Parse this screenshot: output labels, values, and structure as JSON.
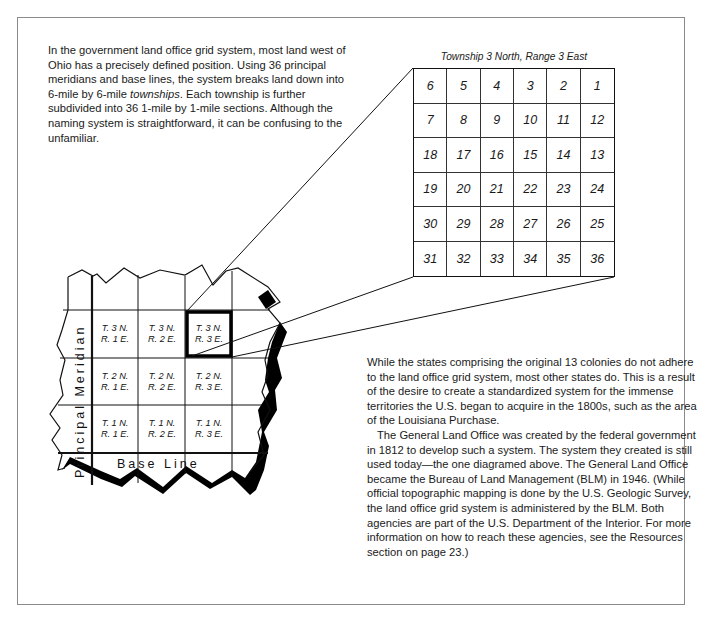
{
  "intro": {
    "line_prefix": "In the government land office grid system, most land west of Ohio has a precisely defined position. Using 36 principal meridians and base lines, the system breaks land down into 6-mile by 6-mile ",
    "emphasis": "townships",
    "line_suffix": ". Each township is further subdivided into 36 1-mile by 1-mile sections. Although the naming system is straightforward, it can be confusing to the unfamiliar."
  },
  "township_diagram": {
    "title": "Township 3 North, Range 3 East",
    "sections": [
      [
        "6",
        "5",
        "4",
        "3",
        "2",
        "1"
      ],
      [
        "7",
        "8",
        "9",
        "10",
        "11",
        "12"
      ],
      [
        "18",
        "17",
        "16",
        "15",
        "14",
        "13"
      ],
      [
        "19",
        "20",
        "21",
        "22",
        "23",
        "24"
      ],
      [
        "30",
        "29",
        "28",
        "27",
        "26",
        "25"
      ],
      [
        "31",
        "32",
        "33",
        "34",
        "35",
        "36"
      ]
    ]
  },
  "grid_map": {
    "meridian_label": "Principal Meridian",
    "baseline_label": "Base Line",
    "highlighted": "T. 3 N. R. 3 E.",
    "cells": [
      {
        "t": "T. 3 N.",
        "r": "R. 1 E."
      },
      {
        "t": "T. 3 N.",
        "r": "R. 2 E."
      },
      {
        "t": "T. 3 N.",
        "r": "R. 3 E."
      },
      {
        "t": "T. 2 N.",
        "r": "R. 1 E."
      },
      {
        "t": "T. 2 N.",
        "r": "R. 2 E."
      },
      {
        "t": "T. 2 N.",
        "r": "R. 3 E."
      },
      {
        "t": "T. 1 N.",
        "r": "R. 1 E."
      },
      {
        "t": "T. 1 N.",
        "r": "R. 2 E."
      },
      {
        "t": "T. 1 N.",
        "r": "R. 3 E."
      }
    ]
  },
  "body": {
    "paragraph1": "While the states comprising the original 13 colonies do not adhere to the land office grid system, most other states do. This is a result of the desire to create a standardized system for the immense territories the U.S. began to acquire in the 1800s, such as the area of the Louisiana Purchase.",
    "paragraph2": "The General Land Office was created by the federal government in 1812 to develop such a system. The system they created is still used today—the one diagramed above. The General Land Office became the Bureau of Land Management (BLM) in 1946. (While official topographic mapping is done by the U.S. Geologic Survey, the land office grid system is administered by the BLM. Both agencies are part of the U.S. Department of the Interior. For more information on how to reach these agencies, see the Resources section on page 23.)"
  }
}
